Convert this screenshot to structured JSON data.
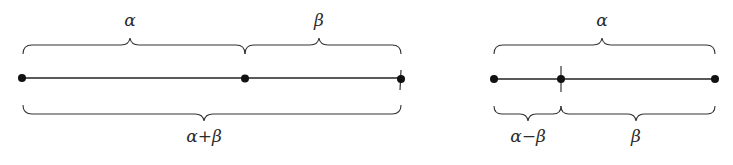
{
  "diagram": {
    "left": {
      "top_labels": [
        "α",
        "β"
      ],
      "bottom_label": "α+β",
      "points": 3
    },
    "right": {
      "top_label": "α",
      "bottom_labels": [
        "α−β",
        "β"
      ],
      "points": 3
    },
    "colors": {
      "ink": "#222222",
      "background": "#ffffff"
    }
  }
}
